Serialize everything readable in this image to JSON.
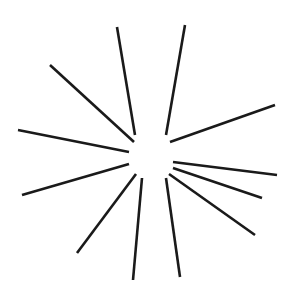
{
  "figure": {
    "name": "starburst-rays-diagram",
    "type": "radial-line-diagram",
    "background_color": "#ffffff",
    "stroke_color": "#1a1a1a",
    "stroke_width": 2.6,
    "canvas": {
      "width": 302,
      "height": 304
    },
    "center": {
      "x": 151,
      "y": 156
    },
    "inner_gap_radius": 22,
    "ray_count": 12,
    "rays": [
      {
        "id": "ray-1",
        "label": "ray-up-left-steep",
        "x1": 135,
        "y1": 135,
        "x2": 117,
        "y2": 27
      },
      {
        "id": "ray-2",
        "label": "ray-up-right-steep",
        "x1": 166,
        "y1": 135,
        "x2": 185,
        "y2": 25
      },
      {
        "id": "ray-3",
        "label": "ray-upper-left-diagonal",
        "x1": 134,
        "y1": 142,
        "x2": 50,
        "y2": 65
      },
      {
        "id": "ray-4",
        "label": "ray-upper-right-diagonal",
        "x1": 170,
        "y1": 142,
        "x2": 275,
        "y2": 105
      },
      {
        "id": "ray-5",
        "label": "ray-left-horizontal",
        "x1": 129,
        "y1": 152,
        "x2": 18,
        "y2": 130
      },
      {
        "id": "ray-6",
        "label": "ray-right-horizontal",
        "x1": 173,
        "y1": 162,
        "x2": 277,
        "y2": 175
      },
      {
        "id": "ray-7",
        "label": "ray-lower-left-shallow",
        "x1": 129,
        "y1": 164,
        "x2": 22,
        "y2": 195
      },
      {
        "id": "ray-8",
        "label": "ray-lower-right-shallow",
        "x1": 173,
        "y1": 168,
        "x2": 262,
        "y2": 198
      },
      {
        "id": "ray-9",
        "label": "ray-lower-left-diagonal",
        "x1": 136,
        "y1": 174,
        "x2": 77,
        "y2": 253
      },
      {
        "id": "ray-10",
        "label": "ray-lower-right-diagonal",
        "x1": 169,
        "y1": 174,
        "x2": 255,
        "y2": 235
      },
      {
        "id": "ray-11",
        "label": "ray-down-left-steep",
        "x1": 142,
        "y1": 178,
        "x2": 133,
        "y2": 280
      },
      {
        "id": "ray-12",
        "label": "ray-down-right-steep",
        "x1": 166,
        "y1": 178,
        "x2": 180,
        "y2": 277
      }
    ]
  },
  "top_edge_artifact": {
    "description": "row of faint clipped glyph bottoms along the very top edge",
    "text": "·   ··   ··   ···"
  }
}
